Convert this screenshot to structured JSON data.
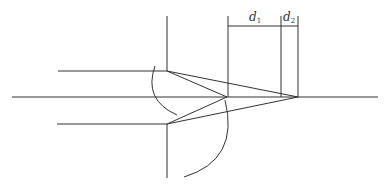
{
  "diagram": {
    "type": "optical ray diagram",
    "labels": {
      "d1": {
        "main": "d",
        "sub": "1"
      },
      "d2": {
        "main": "d",
        "sub": "2"
      }
    },
    "colors": {
      "line": "#333333",
      "background": "#ffffff"
    },
    "elements": [
      "optical axis (horizontal)",
      "upper incident ray",
      "lower incident ray",
      "upper lens/surface edge",
      "lower lens/surface edge",
      "upper arc",
      "lower arc",
      "converging rays to focus 1",
      "converging rays to focus 2",
      "dimension d1",
      "dimension d2"
    ]
  }
}
